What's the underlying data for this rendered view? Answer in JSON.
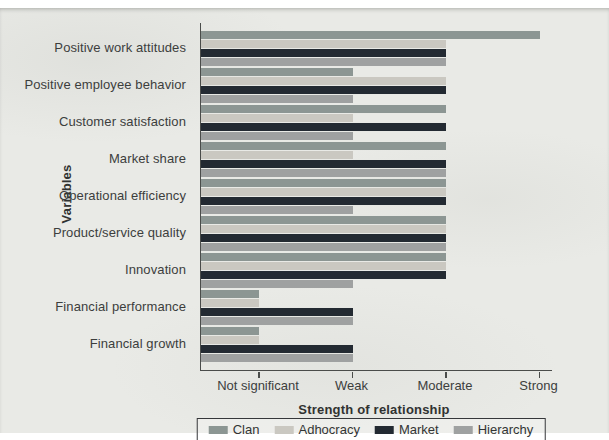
{
  "figure": {
    "background_color": "#e9eae6",
    "axis_color": "#4a4c4a",
    "text_color": "#3c3e3d"
  },
  "chart_data": {
    "type": "bar",
    "orientation": "horizontal",
    "title": "",
    "xlabel": "Strength of relationship",
    "ylabel": "Variables",
    "x_tick_labels": [
      "Not significant",
      "Weak",
      "Moderate",
      "Strong"
    ],
    "value_scale": {
      "1": "Not significant",
      "2": "Weak",
      "3": "Moderate",
      "4": "Strong"
    },
    "axis_range_note": "bars start at axis; values 1-4 correspond to the four ticks",
    "grid": false,
    "legend_position": "bottom",
    "categories": [
      "Positive work attitudes",
      "Positive employee behavior",
      "Customer satisfaction",
      "Market share",
      "Operational efficiency",
      "Product/service quality",
      "Innovation",
      "Financial performance",
      "Financial growth"
    ],
    "series": [
      {
        "name": "Clan",
        "color": "#8c9693",
        "values": [
          4,
          2,
          3,
          3,
          3,
          3,
          3,
          1,
          1
        ]
      },
      {
        "name": "Adhocracy",
        "color": "#cac8c1",
        "values": [
          3,
          3,
          2,
          2,
          3,
          3,
          3,
          1,
          1
        ]
      },
      {
        "name": "Market",
        "color": "#232a32",
        "values": [
          3,
          3,
          3,
          3,
          3,
          3,
          3,
          2,
          2
        ]
      },
      {
        "name": "Hierarchy",
        "color": "#9fa1a1",
        "values": [
          3,
          2,
          2,
          3,
          2,
          3,
          2,
          2,
          2
        ]
      }
    ]
  }
}
